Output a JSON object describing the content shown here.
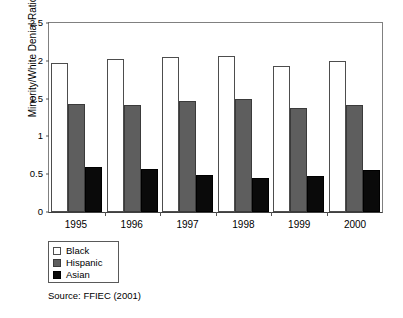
{
  "chart_data": {
    "type": "bar",
    "title": "",
    "subtitle": "",
    "xlabel": "",
    "ylabel": "Minority/White Denial Ratio",
    "categories": [
      "1995",
      "1996",
      "1997",
      "1998",
      "1999",
      "2000"
    ],
    "series": [
      {
        "name": "Black",
        "color": "#ffffff",
        "values": [
          1.97,
          2.03,
          2.05,
          2.06,
          1.93,
          2.0
        ]
      },
      {
        "name": "Hispanic",
        "color": "#5e5e5e",
        "values": [
          1.43,
          1.42,
          1.47,
          1.49,
          1.38,
          1.41
        ]
      },
      {
        "name": "Asian",
        "color": "#0a0a0a",
        "values": [
          0.6,
          0.57,
          0.49,
          0.45,
          0.47,
          0.56
        ]
      }
    ],
    "ylim": [
      0,
      2.5
    ],
    "yticks": [
      "0",
      "0.5",
      "1",
      "1.5",
      "2",
      "2.5"
    ],
    "ytick_values": [
      0,
      0.5,
      1,
      1.5,
      2,
      2.5
    ],
    "grid": false,
    "legend_position": "below-left",
    "annotations": [
      "Source: FFIEC (2001)"
    ]
  },
  "figure": {
    "y_axis_title": "Minority/White Denial Ratio",
    "source_note": "Source: FFIEC (2001)"
  },
  "legend": {
    "items": [
      {
        "label": "Black"
      },
      {
        "label": "Hispanic"
      },
      {
        "label": "Asian"
      }
    ]
  }
}
